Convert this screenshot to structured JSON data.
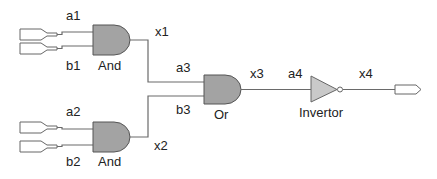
{
  "diagram": {
    "type": "logic-circuit",
    "gates": [
      {
        "id": "and1",
        "kind": "and",
        "label": "And",
        "inputs": [
          "a1",
          "b1"
        ],
        "output": "x1"
      },
      {
        "id": "and2",
        "kind": "and",
        "label": "And",
        "inputs": [
          "a2",
          "b2"
        ],
        "output": "x2"
      },
      {
        "id": "or1",
        "kind": "or",
        "label": "Or",
        "inputs": [
          "a3",
          "b3"
        ],
        "output": "x3"
      },
      {
        "id": "inv1",
        "kind": "not",
        "label": "Invertor",
        "inputs": [
          "a4"
        ],
        "output": "x4"
      }
    ],
    "signals": {
      "a1": "a1",
      "b1": "b1",
      "x1": "x1",
      "a2": "a2",
      "b2": "b2",
      "x2": "x2",
      "a3": "a3",
      "b3": "b3",
      "x3": "x3",
      "a4": "a4",
      "x4": "x4"
    },
    "labels": {
      "and1": "And",
      "and2": "And",
      "or1": "Or",
      "inv1": "Invertor"
    },
    "colors": {
      "gate_fill": "#a3a3a3",
      "inverter_fill": "#c9c9c9",
      "wire": "#6a6a6a"
    }
  }
}
